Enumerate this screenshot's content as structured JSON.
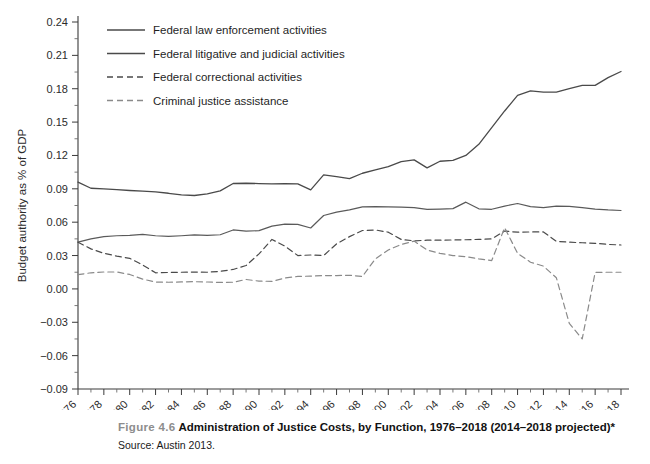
{
  "figure": {
    "number_label": "Figure 4.6",
    "title": "Administration of Justice Costs, by Function, 1976–2018 (2014–2018 projected)*",
    "source": "Source: Austin 2013."
  },
  "chart_data": {
    "type": "line",
    "title": "Administration of Justice Costs, by Function, 1976–2018 (2014–2018 projected)*",
    "xlabel": "",
    "ylabel": "Budget authority as % of GDP",
    "xlim": [
      1976,
      2018
    ],
    "ylim": [
      -0.09,
      0.24
    ],
    "grid": false,
    "legend_position": "top-left-inside",
    "ytick_labels": [
      "0.24",
      "0.21",
      "0.18",
      "0.15",
      "0.12",
      "0.09",
      "0.06",
      "0.03",
      "0.00",
      "−0.03",
      "−0.06",
      "−0.09"
    ],
    "yticks": [
      0.24,
      0.21,
      0.18,
      0.15,
      0.12,
      0.09,
      0.06,
      0.03,
      0.0,
      -0.03,
      -0.06,
      -0.09
    ],
    "xtick_labels": [
      "1976",
      "1978",
      "1980",
      "1982",
      "1984",
      "1986",
      "1988",
      "1990",
      "1992",
      "1994",
      "1996",
      "1998",
      "2000",
      "2002",
      "2004",
      "2006",
      "2008",
      "2010",
      "2012",
      "2014",
      "2016",
      "2018"
    ],
    "xticks": [
      1976,
      1978,
      1980,
      1982,
      1984,
      1986,
      1988,
      1990,
      1992,
      1994,
      1996,
      1998,
      2000,
      2002,
      2004,
      2006,
      2008,
      2010,
      2012,
      2014,
      2016,
      2018
    ],
    "x": [
      1976,
      1977,
      1978,
      1979,
      1980,
      1981,
      1982,
      1983,
      1984,
      1985,
      1986,
      1987,
      1988,
      1989,
      1990,
      1991,
      1992,
      1993,
      1994,
      1995,
      1996,
      1997,
      1998,
      1999,
      2000,
      2001,
      2002,
      2003,
      2004,
      2005,
      2006,
      2007,
      2008,
      2009,
      2010,
      2011,
      2012,
      2013,
      2014,
      2015,
      2016,
      2017,
      2018
    ],
    "series": [
      {
        "name": "Federal law enforcement activities",
        "style": "solid",
        "color": "#4a4a4a",
        "values": [
          0.096,
          0.0905,
          0.09,
          0.0892,
          0.0885,
          0.088,
          0.0872,
          0.086,
          0.0845,
          0.084,
          0.0855,
          0.0882,
          0.0948,
          0.095,
          0.0947,
          0.0945,
          0.0947,
          0.0945,
          0.089,
          0.1025,
          0.101,
          0.0992,
          0.104,
          0.107,
          0.11,
          0.1145,
          0.116,
          0.1088,
          0.1148,
          0.1155,
          0.12,
          0.13,
          0.145,
          0.16,
          0.174,
          0.178,
          0.177,
          0.177,
          0.18,
          0.183,
          0.183,
          0.19,
          0.1955
        ]
      },
      {
        "name": "Federal litigative and judicial activities",
        "style": "solid",
        "color": "#5a5a5a",
        "values": [
          0.042,
          0.045,
          0.047,
          0.0478,
          0.0482,
          0.049,
          0.0478,
          0.0472,
          0.0478,
          0.0485,
          0.0482,
          0.0487,
          0.053,
          0.052,
          0.0524,
          0.0565,
          0.0582,
          0.058,
          0.0548,
          0.066,
          0.069,
          0.071,
          0.0738,
          0.074,
          0.0738,
          0.0735,
          0.073,
          0.0715,
          0.0718,
          0.0722,
          0.078,
          0.072,
          0.0716,
          0.0745,
          0.0768,
          0.074,
          0.073,
          0.0745,
          0.0742,
          0.073,
          0.0718,
          0.071,
          0.0705
        ]
      },
      {
        "name": "Federal correctional activities",
        "style": "dashed",
        "color": "#4a4a4a",
        "values": [
          0.042,
          0.036,
          0.032,
          0.0295,
          0.0275,
          0.0215,
          0.0145,
          0.0148,
          0.015,
          0.0152,
          0.015,
          0.0158,
          0.0175,
          0.021,
          0.0315,
          0.0445,
          0.0385,
          0.03,
          0.0305,
          0.03,
          0.0405,
          0.047,
          0.0525,
          0.053,
          0.051,
          0.0445,
          0.0432,
          0.0438,
          0.0438,
          0.044,
          0.0442,
          0.0445,
          0.045,
          0.052,
          0.051,
          0.0512,
          0.0512,
          0.0428,
          0.042,
          0.0415,
          0.041,
          0.04,
          0.0395
        ]
      },
      {
        "name": "Criminal justice assistance",
        "style": "dashed",
        "color": "#8a8a8a",
        "values": [
          0.0128,
          0.0145,
          0.0152,
          0.0152,
          0.013,
          0.0088,
          0.0062,
          0.006,
          0.0063,
          0.0065,
          0.0062,
          0.0058,
          0.006,
          0.0085,
          0.007,
          0.0068,
          0.0098,
          0.0112,
          0.0115,
          0.012,
          0.012,
          0.0123,
          0.0112,
          0.027,
          0.035,
          0.04,
          0.043,
          0.035,
          0.032,
          0.03,
          0.029,
          0.027,
          0.0255,
          0.055,
          0.032,
          0.024,
          0.0205,
          0.01,
          -0.031,
          -0.045,
          0.0148,
          0.015,
          0.015
        ]
      }
    ]
  },
  "legend": {
    "items": [
      {
        "label": "Federal law enforcement activities",
        "style": "solid"
      },
      {
        "label": "Federal litigative and judicial activities",
        "style": "solid"
      },
      {
        "label": "Federal correctional activities",
        "style": "dashed"
      },
      {
        "label": "Criminal justice assistance",
        "style": "dashed"
      }
    ]
  }
}
